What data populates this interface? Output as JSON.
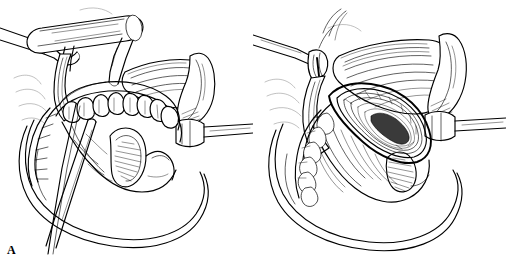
{
  "figure": {
    "type": "medical-surgical-line-illustration",
    "style": "black-and-white pen-and-ink line drawing",
    "background_color": "#ffffff",
    "ink_color": "#000000",
    "panel_count": 2,
    "width_px": 506,
    "height_px": 258
  },
  "panels": [
    {
      "id": "A",
      "label": "A",
      "label_position": "bottom-left",
      "caption": "",
      "description": "Open cleft palate exposed with mouth gag and retractors; dental arch with teeth visible, cleft margins incised",
      "elements": [
        {
          "name": "mouth-gag-bar",
          "kind": "instrument"
        },
        {
          "name": "tongue-blade",
          "kind": "instrument"
        },
        {
          "name": "retractor-hook-left",
          "kind": "instrument"
        },
        {
          "name": "retractor-right",
          "kind": "instrument"
        },
        {
          "name": "suction-probe",
          "kind": "instrument"
        },
        {
          "name": "dental-arch-teeth",
          "kind": "anatomy"
        },
        {
          "name": "hard-palate",
          "kind": "anatomy"
        },
        {
          "name": "cleft-opening",
          "kind": "anatomy"
        },
        {
          "name": "soft-palate-flap",
          "kind": "anatomy"
        },
        {
          "name": "uvula-halves",
          "kind": "anatomy"
        },
        {
          "name": "lip-cheek-margin",
          "kind": "anatomy"
        }
      ]
    },
    {
      "id": "B",
      "label": "B",
      "label_position": "bottom-left",
      "caption": "",
      "description": "Cleft closed in layers; midline suture line running anterior-posterior with knotted sutures, retractors still in place",
      "elements": [
        {
          "name": "retractor-left",
          "kind": "instrument"
        },
        {
          "name": "retractor-right",
          "kind": "instrument"
        },
        {
          "name": "suture-threads",
          "kind": "instrument"
        },
        {
          "name": "closed-suture-line",
          "kind": "anatomy"
        },
        {
          "name": "repaired-palate",
          "kind": "anatomy"
        },
        {
          "name": "mucosal-flap-folds",
          "kind": "anatomy"
        },
        {
          "name": "dental-arch-teeth",
          "kind": "anatomy"
        },
        {
          "name": "uvula",
          "kind": "anatomy"
        },
        {
          "name": "lip-cheek-margin",
          "kind": "anatomy"
        }
      ]
    }
  ]
}
